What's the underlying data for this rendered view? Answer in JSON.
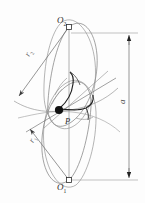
{
  "figure": {
    "type": "engineering-line-diagram",
    "background_color": "#fdfdfd",
    "line_color": "#6f6f6f",
    "accent_line_color": "#1a1a1a",
    "label_color": "#2b2b2b"
  },
  "labels": {
    "center_upper": "O",
    "center_upper_sub": "2",
    "center_lower": "O",
    "center_lower_sub": "1",
    "pitch_point": "P",
    "radius_upper": "r",
    "radius_upper_sub": "2",
    "radius_lower": "r",
    "radius_lower_sub": "1",
    "center_distance": "a"
  },
  "markers": {
    "center_upper_marker": "open-square",
    "center_lower_marker": "open-square",
    "pitch_point_marker": "filled-circle"
  },
  "dimension": {
    "name": "center-distance",
    "symbol": "a",
    "arrow_top_y": 35,
    "arrow_bottom_y": 178,
    "line_x": 129,
    "style": "double-headed-arrow"
  },
  "geometry": {
    "center_upper_point": [
      69,
      27
    ],
    "center_lower_point": [
      69,
      180
    ],
    "pitch_point": [
      58,
      110
    ],
    "radius_vectors": [
      {
        "name": "r2",
        "from": [
          69,
          27
        ],
        "to": [
          16,
          99
        ],
        "arrowhead": "at-end"
      },
      {
        "name": "r1",
        "from": [
          69,
          180
        ],
        "to": [
          27,
          126
        ],
        "arrowhead": "at-end"
      }
    ]
  }
}
